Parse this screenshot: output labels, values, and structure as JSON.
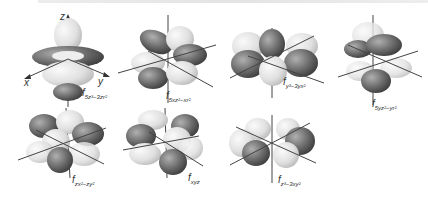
{
  "header": {
    "cropped_text": ""
  },
  "axes": {
    "z": "z",
    "x": "x",
    "y": "y"
  },
  "orbitals": [
    {
      "id": "fz3",
      "prefix": "f",
      "sub": "5z³−3zr²"
    },
    {
      "id": "fxz2",
      "prefix": "f",
      "sub": "5xz²−xr²"
    },
    {
      "id": "fyz2",
      "prefix": "f",
      "sub": "y³−3yx²"
    },
    {
      "id": "fzx2y2",
      "prefix": "f",
      "sub": "5yz²−yr²"
    },
    {
      "id": "fzxy",
      "prefix": "f",
      "sub": "zx²−zy²"
    },
    {
      "id": "fxyz",
      "prefix": "f",
      "sub": "xyz"
    },
    {
      "id": "fx3",
      "prefix": "f",
      "sub": "z³−3xy²"
    }
  ],
  "colors": {
    "dark_lobe": "#6e6e6e",
    "light_lobe": "#e6e6e6",
    "axis": "#444444"
  }
}
